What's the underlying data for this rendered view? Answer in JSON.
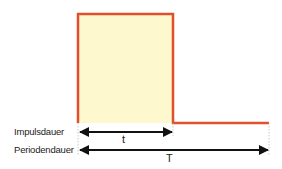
{
  "diagram": {
    "labels": {
      "pulse_duration": "Impulsdauer",
      "period_duration": "Periodendauer",
      "pulse_symbol": "t",
      "period_symbol": "T"
    },
    "colors": {
      "signal_line": "#e0502a",
      "pulse_fill": "#fdf8cd",
      "arrow": "#111111",
      "guide": "#bbbbbb"
    }
  }
}
